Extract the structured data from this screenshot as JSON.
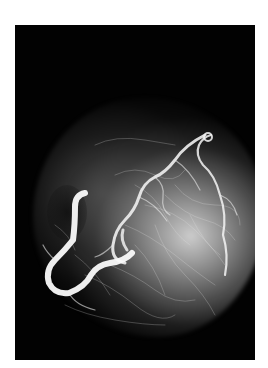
{
  "image": {
    "subject": "coronary vascular angiogram of a heart",
    "style": "grayscale",
    "background_color": "#020202",
    "border_color": "#ffffff"
  }
}
